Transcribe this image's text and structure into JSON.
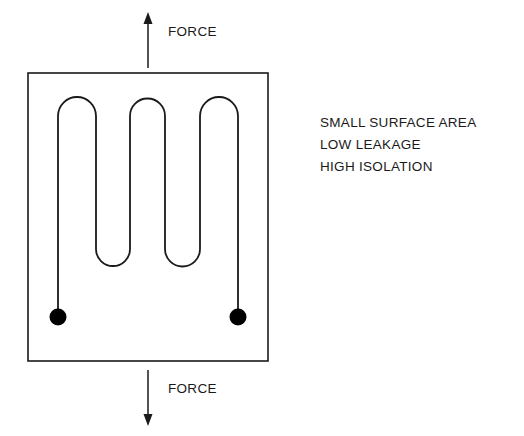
{
  "figure": {
    "colors": {
      "stroke": "#1a1a1a",
      "background": "#ffffff",
      "terminal_fill": "#000000"
    },
    "enclosure": {
      "name": "substrate-boundary",
      "shape": "rectangle",
      "x": 28,
      "y": 73,
      "width": 240,
      "height": 288,
      "stroke_width": 1.6
    },
    "serpentine": {
      "name": "serpentine-trace",
      "stroke_width": 1.8,
      "turn_count": 5,
      "top_arch_peak_y": 97,
      "bottom_arch_valley_y": 268,
      "vertical_line_x": [
        58,
        96,
        130,
        165,
        200,
        238
      ],
      "path": "M 58 317 L 58 116 A 19 19 0 0 1 96 116 L 96 249 A 17 17 0 0 0 130 249 L 130 116 A 17.5 17.5 0 0 1 165 116 L 165 249 A 17.5 17.5 0 0 0 200 249 L 200 116 A 19 19 0 0 1 238 116 L 238 317"
    },
    "terminals": [
      {
        "name": "terminal-left",
        "cx": 58,
        "cy": 317,
        "r": 8.5
      },
      {
        "name": "terminal-right",
        "cx": 238,
        "cy": 317,
        "r": 8.5
      }
    ],
    "arrows": {
      "top": {
        "name": "force-arrow-up",
        "direction": "up",
        "label": "FORCE",
        "x": 148,
        "y_tail": 68,
        "y_head": 14,
        "head_size": 5.5
      },
      "bottom": {
        "name": "force-arrow-down",
        "direction": "down",
        "label": "FORCE",
        "x": 148,
        "y_tail": 370,
        "y_head": 424,
        "head_size": 5.5
      }
    }
  },
  "properties": {
    "heading": "",
    "lines": [
      "SMALL SURFACE AREA",
      "LOW LEAKAGE",
      "HIGH ISOLATION"
    ]
  }
}
